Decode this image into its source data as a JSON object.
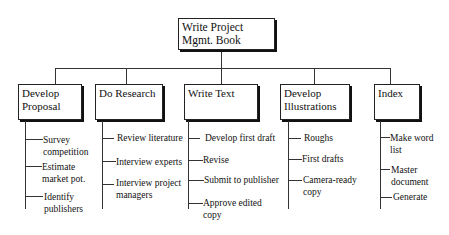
{
  "root": {
    "label": "Write Project Mgmt. Book",
    "lines": [
      "Write Project",
      "Mgmt. Book"
    ]
  },
  "branches": [
    {
      "title": "Develop Proposal",
      "lines": [
        "Develop",
        "Proposal"
      ],
      "tasks": [
        [
          "Survey",
          "competition"
        ],
        [
          "Estimate",
          "market pot."
        ],
        [
          "Identify",
          "publishers"
        ]
      ]
    },
    {
      "title": "Do Research",
      "lines": [
        "Do Research"
      ],
      "tasks": [
        [
          "Review literature"
        ],
        [
          "Interview experts"
        ],
        [
          "Interview project",
          "managers"
        ]
      ]
    },
    {
      "title": "Write Text",
      "lines": [
        "Write Text"
      ],
      "tasks": [
        [
          "Develop first draft"
        ],
        [
          "Revise"
        ],
        [
          "Submit to publisher"
        ],
        [
          "Approve edited",
          "copy"
        ]
      ]
    },
    {
      "title": "Develop Illustrations",
      "lines": [
        "Develop",
        "Illustrations"
      ],
      "tasks": [
        [
          "Roughs"
        ],
        [
          "First drafts"
        ],
        [
          "Camera-ready",
          "copy"
        ]
      ]
    },
    {
      "title": "Index",
      "lines": [
        "Index"
      ],
      "tasks": [
        [
          "Make word",
          "list"
        ],
        [
          "Master",
          "document"
        ],
        [
          "Generate"
        ]
      ]
    }
  ]
}
